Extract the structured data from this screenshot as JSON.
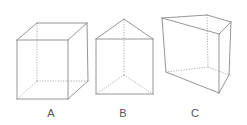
{
  "figure": {
    "shapes": [
      {
        "id": "A",
        "label": "A",
        "kind": "cube",
        "solid_edges": [
          [
            17,
            40,
            68,
            40
          ],
          [
            68,
            40,
            68,
            99
          ],
          [
            68,
            99,
            17,
            99
          ],
          [
            17,
            99,
            17,
            40
          ],
          [
            17,
            40,
            37,
            23
          ],
          [
            37,
            23,
            87,
            23
          ],
          [
            87,
            23,
            68,
            40
          ],
          [
            87,
            23,
            88,
            81
          ],
          [
            88,
            81,
            68,
            99
          ]
        ],
        "hidden_edges": [
          [
            37,
            23,
            37,
            81
          ],
          [
            37,
            81,
            88,
            81
          ],
          [
            37,
            81,
            17,
            99
          ]
        ]
      },
      {
        "id": "B",
        "label": "B",
        "kind": "triangular-prism",
        "solid_edges": [
          [
            124,
            19,
            96,
            39
          ],
          [
            124,
            19,
            153,
            39
          ],
          [
            96,
            39,
            153,
            39
          ],
          [
            96,
            39,
            96,
            94
          ],
          [
            153,
            39,
            153,
            94
          ],
          [
            96,
            94,
            153,
            94
          ]
        ],
        "hidden_edges": [
          [
            124,
            19,
            124,
            75
          ],
          [
            124,
            75,
            96,
            94
          ],
          [
            124,
            75,
            153,
            94
          ]
        ]
      },
      {
        "id": "C",
        "label": "C",
        "kind": "triangular-prism",
        "solid_edges": [
          [
            162,
            18,
            207,
            15
          ],
          [
            207,
            15,
            231,
            22
          ],
          [
            162,
            18,
            219,
            34
          ],
          [
            219,
            34,
            231,
            22
          ],
          [
            162,
            18,
            166,
            72
          ],
          [
            219,
            34,
            219,
            93
          ],
          [
            231,
            22,
            229,
            75
          ],
          [
            166,
            72,
            219,
            93
          ],
          [
            219,
            93,
            229,
            75
          ]
        ],
        "hidden_edges": [
          [
            207,
            15,
            208,
            67
          ],
          [
            208,
            67,
            166,
            72
          ],
          [
            208,
            67,
            229,
            75
          ]
        ]
      }
    ],
    "labels": [
      {
        "text": "A",
        "x": 41
      },
      {
        "text": "B",
        "x": 113
      },
      {
        "text": "C",
        "x": 185
      }
    ],
    "colors": {
      "edge": "#8a8a8a",
      "hidden_edge": "#9a9a9a",
      "label": "#555555",
      "background": "#ffffff"
    }
  }
}
